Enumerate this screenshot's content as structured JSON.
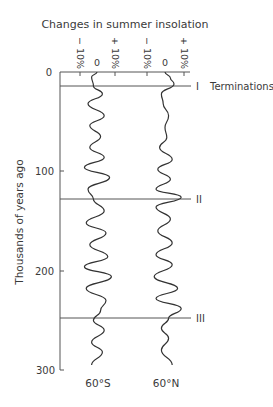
{
  "chart_data": {
    "type": "line",
    "title": "Changes in summer insolation",
    "ylabel": "Thousands of years ago",
    "ylim": [
      0,
      300
    ],
    "yticks": [
      0,
      100,
      200,
      300
    ],
    "y_inverted": true,
    "xtick_labels": [
      "− 10%",
      "0",
      "+ 10%",
      "− 10%",
      "0",
      "+ 10%"
    ],
    "series": [
      {
        "name": "60°S",
        "label": "60°S",
        "age_kyr": [
          0,
          5,
          14,
          22,
          32,
          44,
          54,
          65,
          76,
          86,
          96,
          106,
          118,
          128,
          140,
          152,
          162,
          174,
          186,
          196,
          206,
          218,
          230,
          240,
          250,
          260,
          272,
          282,
          295
        ],
        "insolation_pct": [
          0,
          -3,
          -2,
          3,
          -5,
          4,
          -4,
          2,
          -4,
          4,
          -7,
          7,
          -5,
          -2,
          4,
          -6,
          5,
          -4,
          6,
          -7,
          8,
          -6,
          5,
          2,
          -2,
          4,
          -3,
          3,
          -3
        ]
      },
      {
        "name": "60°N",
        "label": "60°N",
        "age_kyr": [
          0,
          6,
          12,
          22,
          32,
          44,
          56,
          66,
          76,
          88,
          98,
          108,
          118,
          126,
          136,
          148,
          160,
          172,
          184,
          194,
          206,
          218,
          228,
          238,
          248,
          258,
          268,
          280,
          295
        ],
        "insolation_pct": [
          0,
          3,
          5,
          -2,
          -1,
          2,
          0,
          1,
          -3,
          4,
          -4,
          3,
          -5,
          9,
          -5,
          3,
          -4,
          4,
          -5,
          4,
          -6,
          7,
          -5,
          9,
          2,
          -2,
          2,
          -2,
          4
        ]
      }
    ],
    "annotations": [
      {
        "label": "I",
        "age_kyr": 14,
        "text": "Terminations"
      },
      {
        "label": "II",
        "age_kyr": 128
      },
      {
        "label": "III",
        "age_kyr": 248
      }
    ]
  },
  "labels": {
    "title": "Changes in summer insolation",
    "ylabel": "Thousands of years ago",
    "y0": "0",
    "y100": "100",
    "y200": "200",
    "y300": "300",
    "minus10": "− 10%",
    "zero": "0",
    "plus10": "+ 10%",
    "term1": "I",
    "term2": "II",
    "term3": "III",
    "terminations": "Terminations",
    "s_label": "60°S",
    "n_label": "60°N"
  }
}
